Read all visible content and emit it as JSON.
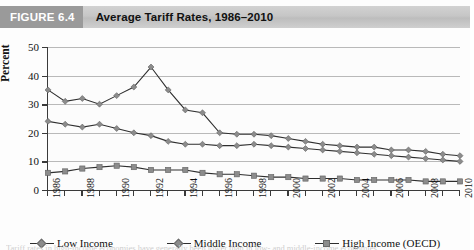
{
  "figure": {
    "tag": "FIGURE 6.4",
    "title": "Average Tariff Rates, 1986–2010",
    "caption": "Tariff rates in high-income economies have generally been lower than in low- and middle-income economies."
  },
  "legend": {
    "position": "bottom",
    "items": [
      {
        "label": "Low Income",
        "marker": "diamond",
        "color": "#8c8c8c"
      },
      {
        "label": "Middle Income",
        "marker": "diamond",
        "color": "#8c8c8c"
      },
      {
        "label": "High Income (OECD)",
        "marker": "square",
        "color": "#8c8c8c"
      }
    ]
  },
  "chart_data": {
    "type": "line",
    "title": "Average Tariff Rates, 1986–2010",
    "xlabel": "",
    "ylabel": "Percent",
    "ylim": [
      0,
      50
    ],
    "ytick_values": [
      0,
      10,
      20,
      30,
      40,
      50
    ],
    "grid": true,
    "x": [
      1986,
      1987,
      1988,
      1989,
      1990,
      1991,
      1992,
      1993,
      1994,
      1995,
      1996,
      1997,
      1998,
      1999,
      2000,
      2001,
      2002,
      2003,
      2004,
      2005,
      2006,
      2007,
      2008,
      2009,
      2010
    ],
    "xtick_labels": [
      "1986",
      "1988",
      "1990",
      "1992",
      "1994",
      "1996",
      "1998",
      "2000",
      "2002",
      "2004",
      "2006",
      "2008",
      "2010"
    ],
    "xtick_years": [
      1986,
      1988,
      1990,
      1992,
      1994,
      1996,
      1998,
      2000,
      2002,
      2004,
      2006,
      2008,
      2010
    ],
    "series": [
      {
        "name": "Low Income",
        "marker": "diamond",
        "color": "#8c8c8c",
        "values": [
          35,
          31,
          32,
          30,
          33,
          36,
          43,
          35,
          28,
          27,
          20,
          19.5,
          19.5,
          19,
          18,
          17,
          16,
          15.5,
          15,
          15,
          14,
          14,
          13.5,
          12.5,
          12
        ]
      },
      {
        "name": "Middle Income",
        "marker": "diamond",
        "color": "#8c8c8c",
        "values": [
          24,
          23,
          22,
          23,
          21.5,
          20,
          19,
          17,
          16,
          16,
          15.5,
          15.5,
          16,
          15.5,
          15,
          14.5,
          14,
          13.5,
          13,
          12.5,
          12,
          11.5,
          11,
          10.5,
          10
        ]
      },
      {
        "name": "High Income (OECD)",
        "marker": "square",
        "color": "#8c8c8c",
        "values": [
          6,
          6.5,
          7.5,
          8,
          8.5,
          8,
          7,
          7,
          7,
          6,
          5.5,
          5.5,
          5,
          4.5,
          4.5,
          4,
          4,
          4,
          3.5,
          3.5,
          3.5,
          3.5,
          3,
          3,
          3
        ]
      }
    ]
  }
}
